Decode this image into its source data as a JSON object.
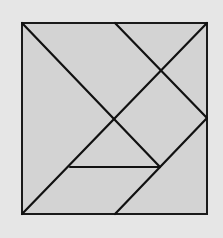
{
  "diagram": {
    "type": "tangram-square",
    "colors": {
      "background": "#e6e6e6",
      "fill": "#d3d3d3",
      "stroke": "#1a1a1a"
    },
    "square": {
      "x": 22,
      "y": 23,
      "width": 185,
      "height": 191
    },
    "lines": [
      {
        "name": "main-diagonal",
        "x1": 22,
        "y1": 23,
        "x2": 160,
        "y2": 167
      },
      {
        "name": "anti-diagonal",
        "x1": 207,
        "y1": 23,
        "x2": 22,
        "y2": 214
      },
      {
        "name": "upper-right-cut",
        "x1": 115,
        "y1": 23,
        "x2": 207,
        "y2": 118
      },
      {
        "name": "lower-right-cut",
        "x1": 207,
        "y1": 118,
        "x2": 115,
        "y2": 214
      },
      {
        "name": "horizontal-cut",
        "x1": 70,
        "y1": 167,
        "x2": 160,
        "y2": 167
      }
    ]
  }
}
